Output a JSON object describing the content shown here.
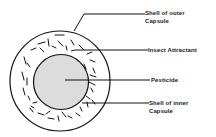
{
  "diagram": {
    "colors": {
      "stroke": "#111111",
      "inner_fill": "#dcdcdc",
      "background": "#ffffff",
      "text": "#222222"
    },
    "outer_capsule": {
      "cx": 60,
      "cy": 81,
      "r": 50
    },
    "inner_capsule": {
      "cx": 61,
      "cy": 82,
      "r": 27.5
    },
    "labels": [
      {
        "id": "shell-outer",
        "line1": "Shell of outer",
        "line2": "Capsule",
        "x": 145,
        "y": 9,
        "leader": [
          [
            74,
            31
          ],
          [
            84,
            14
          ],
          [
            145,
            14
          ]
        ]
      },
      {
        "id": "insect-attractant",
        "line1": "Insect Attractant",
        "line2": "",
        "x": 148,
        "y": 46,
        "leader": [
          [
            71,
            51
          ],
          [
            75,
            50
          ],
          [
            148,
            50
          ]
        ]
      },
      {
        "id": "pesticide",
        "line1": "Pesticide",
        "line2": "",
        "x": 151,
        "y": 76,
        "leader": [
          [
            65,
            80
          ],
          [
            150,
            80
          ]
        ]
      },
      {
        "id": "shell-inner",
        "line1": "Shell of inner",
        "line2": "Capsule",
        "x": 149,
        "y": 99,
        "leader": [
          [
            82,
            103
          ],
          [
            149,
            103
          ]
        ]
      }
    ],
    "attractant_particles": [
      [
        55,
        35,
        64,
        35
      ],
      [
        38,
        44,
        45,
        42
      ],
      [
        48,
        39,
        49,
        46
      ],
      [
        58,
        41,
        63,
        46
      ],
      [
        71,
        40,
        74,
        45
      ],
      [
        79,
        45,
        84,
        50
      ],
      [
        31,
        50,
        36,
        48
      ],
      [
        24,
        57,
        26,
        64
      ],
      [
        27,
        63,
        30,
        67
      ],
      [
        22,
        72,
        24,
        80
      ],
      [
        27,
        78,
        27,
        85
      ],
      [
        23,
        88,
        25,
        95
      ],
      [
        28,
        96,
        30,
        100
      ],
      [
        87,
        54,
        92,
        52
      ],
      [
        90,
        60,
        95,
        62
      ],
      [
        93,
        68,
        95,
        73
      ],
      [
        90,
        75,
        96,
        77
      ],
      [
        89,
        82,
        95,
        85
      ],
      [
        91,
        88,
        93,
        92
      ],
      [
        86,
        96,
        90,
        99
      ],
      [
        87,
        102,
        88,
        107
      ],
      [
        92,
        100,
        95,
        104
      ],
      [
        33,
        103,
        37,
        102
      ],
      [
        30,
        108,
        33,
        112
      ],
      [
        38,
        113,
        44,
        115
      ],
      [
        46,
        114,
        50,
        111
      ],
      [
        48,
        118,
        54,
        119
      ],
      [
        58,
        116,
        59,
        121
      ],
      [
        62,
        112,
        66,
        117
      ],
      [
        68,
        116,
        72,
        118
      ],
      [
        76,
        113,
        80,
        116
      ],
      [
        80,
        107,
        82,
        111
      ],
      [
        40,
        48,
        44,
        52
      ],
      [
        84,
        64,
        86,
        69
      ],
      [
        31,
        106,
        34,
        108
      ],
      [
        66,
        46,
        67,
        50
      ],
      [
        52,
        46,
        56,
        48
      ]
    ]
  }
}
